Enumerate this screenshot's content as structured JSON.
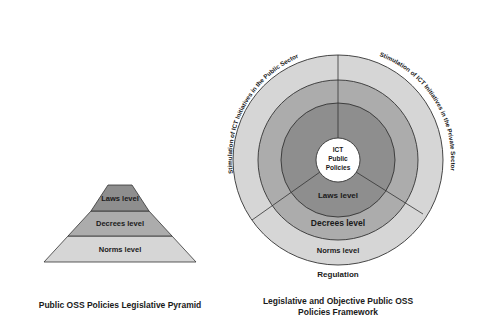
{
  "pyramid": {
    "caption": "Public OSS Policies Legislative Pyramid",
    "levels": [
      {
        "label": "Laws level",
        "color": "#8e8e8e"
      },
      {
        "label": "Decrees level",
        "color": "#acacac"
      },
      {
        "label": "Norms level",
        "color": "#d6d6d6"
      }
    ]
  },
  "framework": {
    "caption_line1": "Legislative and Objective Public OSS",
    "caption_line2": "Policies Framework",
    "center_line1": "ICT",
    "center_line2": "Public",
    "center_line3": "Policies",
    "rings": [
      {
        "label": "Laws level",
        "color": "#8e8e8e"
      },
      {
        "label": "Decrees level",
        "color": "#acacac"
      },
      {
        "label": "Norms level",
        "color": "#d6d6d6"
      }
    ],
    "sector_labels": {
      "left": "Stimulation of ICT Initiatives in the Public Sector",
      "right": "Stimulation of ICT Initiatives in the Private Sector",
      "bottom": "Regulation"
    }
  }
}
